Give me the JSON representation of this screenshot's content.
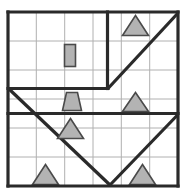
{
  "diagram": {
    "grid": {
      "columns": 6,
      "rows": 6,
      "x0": 8,
      "y0": 12,
      "x1": 178,
      "y1": 186,
      "line_color": "#b0b0b0",
      "wall_color": "#2a2a2a"
    },
    "border": [
      {
        "name": "border-top",
        "x1": 8,
        "y1": 12,
        "x2": 178,
        "y2": 12
      },
      {
        "name": "border-right",
        "x1": 178,
        "y1": 12,
        "x2": 178,
        "y2": 186
      },
      {
        "name": "border-bottom",
        "x1": 8,
        "y1": 186,
        "x2": 178,
        "y2": 186
      },
      {
        "name": "border-left",
        "x1": 8,
        "y1": 12,
        "x2": 8,
        "y2": 186
      }
    ],
    "grid_lines_vertical": [
      {
        "name": "grid-v-1",
        "x": 36.3
      },
      {
        "name": "grid-v-2",
        "x": 64.7
      },
      {
        "name": "grid-v-3",
        "x": 93.0
      },
      {
        "name": "grid-v-4",
        "x": 121.3
      },
      {
        "name": "grid-v-5",
        "x": 149.7
      }
    ],
    "grid_lines_horizontal": [
      {
        "name": "grid-h-1",
        "y": 41.0
      },
      {
        "name": "grid-h-2",
        "y": 70.0
      },
      {
        "name": "grid-h-3",
        "y": 99.0
      },
      {
        "name": "grid-h-4",
        "y": 128.0
      },
      {
        "name": "grid-h-5",
        "y": 157.0
      }
    ],
    "walls": [
      {
        "name": "wall-vertical-upper-middle",
        "x1": 107.5,
        "y1": 12,
        "x2": 107.5,
        "y2": 88.5
      },
      {
        "name": "wall-horizontal-upper",
        "x1": 8,
        "y1": 88.5,
        "x2": 108,
        "y2": 88.5
      },
      {
        "name": "wall-horizontal-lower",
        "x1": 8,
        "y1": 113.5,
        "x2": 178,
        "y2": 113.5
      }
    ],
    "diagonals": [
      {
        "name": "diagonal-top-right-rising",
        "x1": 108,
        "y1": 88.5,
        "x2": 178,
        "y2": 13
      },
      {
        "name": "diagonal-long-falling",
        "x1": 9,
        "y1": 89,
        "x2": 110,
        "y2": 185
      },
      {
        "name": "diagonal-bottom-right-rising",
        "x1": 110,
        "y1": 185,
        "x2": 178,
        "y2": 114.5
      }
    ],
    "pieces": [
      {
        "name": "piece-rectangle-r2c3",
        "shape": "rectangle",
        "fill": "#b3b3b3",
        "stroke": "#4a4a4a",
        "x": 64.5,
        "y": 44.5,
        "width": 11,
        "height": 22
      },
      {
        "name": "piece-triangle-r1c5",
        "shape": "triangle",
        "fill": "#b3b3b3",
        "stroke": "#4a4a4a",
        "points": "135.5,15.5 148.5,35.5 122.5,35.5"
      },
      {
        "name": "piece-trapezoid-r4c3",
        "shape": "trapezoid",
        "fill": "#b3b3b3",
        "stroke": "#4a4a4a",
        "points": "66.5,92.5 77.5,92.5 81.5,110.5 62.5,110.5"
      },
      {
        "name": "piece-triangle-r4c5",
        "shape": "triangle",
        "fill": "#b3b3b3",
        "stroke": "#4a4a4a",
        "points": "135.5,92.5 148.5,111.5 122.5,111.5"
      },
      {
        "name": "piece-triangle-r5c3",
        "shape": "triangle",
        "fill": "#b3b3b3",
        "stroke": "#4a4a4a",
        "points": "70.5,118.5 83.5,138.5 57.5,138.5"
      },
      {
        "name": "piece-triangle-r6c2",
        "shape": "triangle",
        "fill": "#b3b3b3",
        "stroke": "#4a4a4a",
        "points": "45.5,164.5 58.5,184.5 32.5,184.5"
      },
      {
        "name": "piece-triangle-r6c5",
        "shape": "triangle",
        "fill": "#b3b3b3",
        "stroke": "#4a4a4a",
        "points": "142.5,164.5 155.5,184.5 129.5,184.5"
      }
    ]
  }
}
